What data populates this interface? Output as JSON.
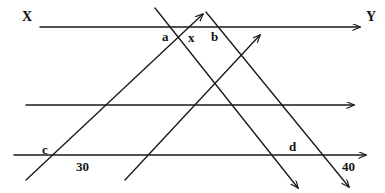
{
  "figure": {
    "type": "geometry-diagram",
    "width": 385,
    "height": 193,
    "stroke_color": "#1a1a1a",
    "background_color": "#ffffff"
  },
  "labels": {
    "ray_start": "X",
    "ray_end": "Y",
    "angle_a": "a",
    "angle_x": "x",
    "angle_b": "b",
    "angle_c": "c",
    "angle_d": "d",
    "degrees_left": "30",
    "degrees_right": "40"
  },
  "label_positions": {
    "ray_start": {
      "x": 22,
      "y": 10
    },
    "ray_end": {
      "x": 366,
      "y": 10
    },
    "angle_a": {
      "x": 162,
      "y": 30
    },
    "angle_x": {
      "x": 188,
      "y": 31
    },
    "angle_b": {
      "x": 211,
      "y": 30
    },
    "angle_c": {
      "x": 42,
      "y": 143
    },
    "angle_d": {
      "x": 289,
      "y": 140
    },
    "degrees_left": {
      "x": 76,
      "y": 160
    },
    "degrees_right": {
      "x": 342,
      "y": 160
    }
  },
  "geometry": {
    "horizontal_lines": [
      {
        "name": "top-line",
        "x1": 40,
        "y1": 27,
        "x2": 362,
        "y2": 27,
        "arrow_end": true
      },
      {
        "name": "middle-line",
        "x1": 26,
        "y1": 105,
        "x2": 356,
        "y2": 105,
        "arrow_end": true
      },
      {
        "name": "bottom-line",
        "x1": 14,
        "y1": 155,
        "x2": 368,
        "y2": 155,
        "arrow_end": true
      }
    ],
    "transversals_up_right": [
      {
        "name": "transversal-1",
        "x1": 26,
        "y1": 180,
        "x2": 205,
        "y2": 12,
        "arrow_end": true
      },
      {
        "name": "transversal-2",
        "x1": 125,
        "y1": 180,
        "x2": 262,
        "y2": 33,
        "arrow_end": true
      }
    ],
    "transversals_down_right": [
      {
        "name": "transversal-3",
        "x1": 155,
        "y1": 8,
        "x2": 300,
        "y2": 190,
        "arrow_end": true
      },
      {
        "name": "transversal-4",
        "x1": 206,
        "y1": 12,
        "x2": 351,
        "y2": 189,
        "arrow_end": true
      }
    ]
  }
}
